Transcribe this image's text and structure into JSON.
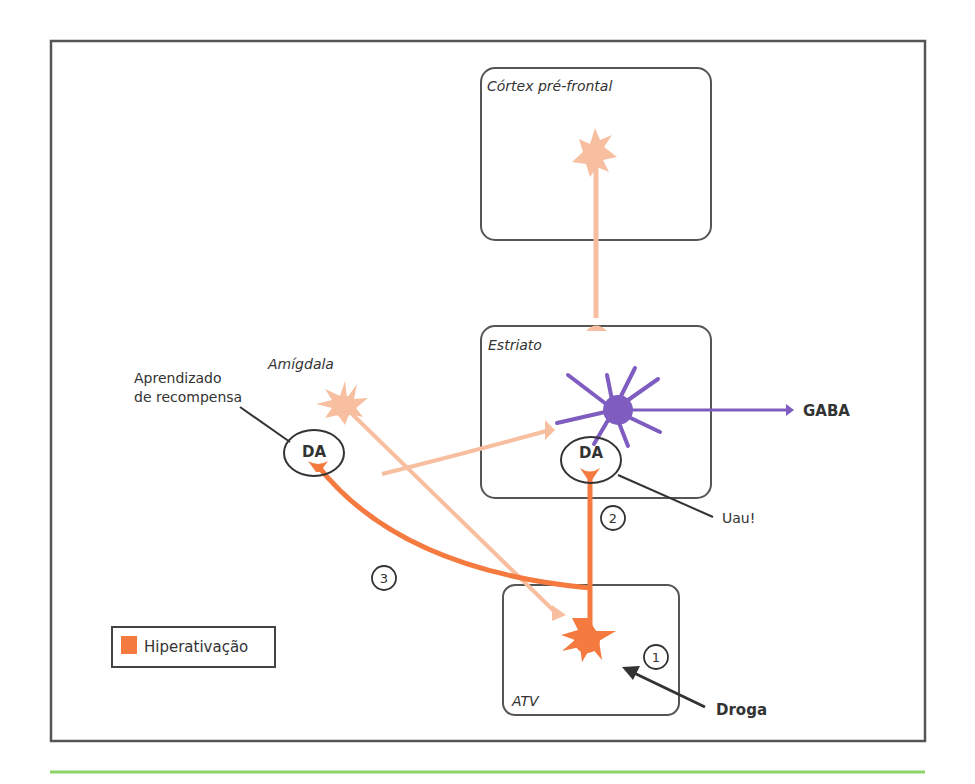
{
  "diagram": {
    "regions": {
      "cortex": "Córtex pré-frontal",
      "striatum": "Estriato",
      "amygdala": "Amígdala",
      "vta": "ATV"
    },
    "annotations": {
      "reward_learning_line1": "Aprendizado",
      "reward_learning_line2": "de recompensa",
      "wow": "Uau!",
      "gaba": "GABA",
      "drug": "Droga",
      "da_amygdala": "DA",
      "da_striatum": "DA"
    },
    "steps": [
      "1",
      "2",
      "3"
    ],
    "legend": {
      "label": "Hiperativação",
      "color": "#f47a40"
    },
    "colors": {
      "hyperactive": "#f47a40",
      "normal": "#f7bfa0",
      "gaba_neuron": "#7e5cc0",
      "frame": "#555555",
      "bottom_rule": "#8ed36a"
    }
  }
}
